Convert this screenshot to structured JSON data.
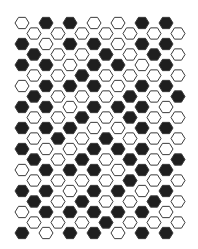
{
  "pattern": {
    "colors": {
      "dark": "#1f1f1f",
      "light": "#ffffff",
      "stroke": "#3a3a3a"
    },
    "hex": {
      "radius": 7,
      "col_step": 24,
      "row_step": 10.5,
      "x0": 22,
      "y0": 23,
      "odd_offset": 12
    },
    "rows": [
      "0110011",
      "0000000",
      "1011011",
      "1001010",
      "1101101",
      "0010000",
      "0111011",
      "1000101",
      "1101110",
      "0010100",
      "1110011",
      "0101000",
      "1001110",
      "1010101",
      "0111011",
      "0000100",
      "1101101",
      "1010010",
      "0111110",
      "0001000",
      "1011011"
    ]
  }
}
